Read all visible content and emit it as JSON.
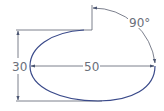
{
  "diagram": {
    "type": "technical-drawing",
    "colors": {
      "outline": "#3a4a8a",
      "dimension": "#5a6070",
      "text": "#6b6f7a",
      "background": "#ffffff"
    },
    "dimensions": {
      "height_label": "30",
      "width_label": "50",
      "angle_label": "90°"
    }
  }
}
